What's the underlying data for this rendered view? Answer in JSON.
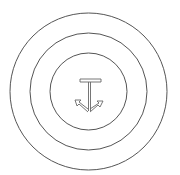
{
  "diagram": {
    "title": "",
    "rings": [
      {
        "name": "outer-ring"
      },
      {
        "name": "middle-ring"
      },
      {
        "name": "inner-ring"
      }
    ],
    "center_symbol": {
      "name": "anchor-icon",
      "parts": [
        "top-bar",
        "stem",
        "left-arrowhead",
        "right-arrowhead"
      ]
    },
    "colors": {
      "background": "#ffffff",
      "ring_stroke": "#555555",
      "symbol_stroke": "#666666"
    }
  }
}
